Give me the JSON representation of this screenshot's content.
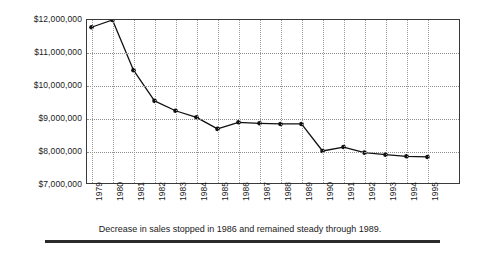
{
  "caption": "Decrease in sales stopped in 1986 and remained steady through 1989.",
  "axes": {
    "y_tick_labels": [
      "$12,000,000",
      "$11,000,000",
      "$10,000,000",
      "$9,000,000",
      "$8,000,000",
      "$7,000,000"
    ],
    "x_tick_labels": [
      "1979",
      "1980",
      "1981",
      "1982",
      "1983",
      "1984",
      "1985",
      "1986",
      "1987",
      "1988",
      "1989",
      "1990",
      "1991",
      "1992",
      "1993",
      "1994",
      "1995"
    ]
  },
  "style": {
    "line_color": "#111111",
    "marker_color": "#111111",
    "grid_color": "#8d8d8d",
    "frame_color": "#3a3a3a",
    "rule_color": "#2b2b2b",
    "background": "#ffffff"
  },
  "chart_data": {
    "type": "line",
    "title": "",
    "subtitle": "",
    "xlabel": "",
    "ylabel": "",
    "x": [
      "1979",
      "1980",
      "1981",
      "1982",
      "1983",
      "1984",
      "1985",
      "1986",
      "1987",
      "1988",
      "1989",
      "1990",
      "1991",
      "1992",
      "1993",
      "1994",
      "1995"
    ],
    "values": [
      11780000,
      12000000,
      10480000,
      9550000,
      9250000,
      9050000,
      8700000,
      8900000,
      8870000,
      8850000,
      8850000,
      8030000,
      8150000,
      7980000,
      7920000,
      7870000,
      7850000
    ],
    "series": [
      {
        "name": "Sales",
        "values": [
          11780000,
          12000000,
          10480000,
          9550000,
          9250000,
          9050000,
          8700000,
          8900000,
          8870000,
          8850000,
          8850000,
          8030000,
          8150000,
          7980000,
          7920000,
          7870000,
          7850000
        ]
      }
    ],
    "ylim": [
      7000000,
      12000000
    ],
    "ytick_values": [
      12000000,
      11000000,
      10000000,
      9000000,
      8000000,
      7000000
    ],
    "ytick_labels": [
      "$12,000,000",
      "$11,000,000",
      "$10,000,000",
      "$9,000,000",
      "$8,000,000",
      "$7,000,000"
    ],
    "grid": true,
    "grid_style": "dotted",
    "legend": false,
    "legend_position": "none",
    "markers": true,
    "marker_shape": "circle",
    "annotations": [
      "Decrease in sales stopped in 1986 and remained steady through 1989."
    ]
  }
}
